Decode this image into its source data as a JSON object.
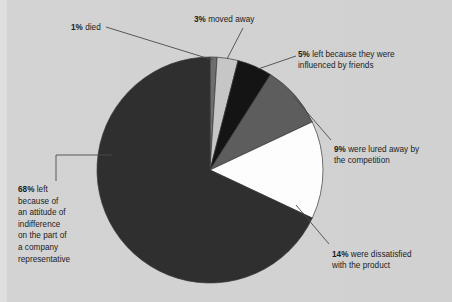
{
  "chart_data": {
    "type": "pie",
    "title": "",
    "subtitle": "",
    "xlabel": "",
    "ylabel": "",
    "legend_position": "callout-labels",
    "grid": false,
    "start_angle_deg": 0,
    "direction": "clockwise",
    "categories": [
      "died",
      "moved away",
      "left because they were influenced by friends",
      "were lured away by the competition",
      "were dissatisfied with the product",
      "left because of an attitude of indifference on the part of a company representative"
    ],
    "values": [
      1,
      3,
      5,
      9,
      14,
      68
    ],
    "value_unit": "%",
    "slice_colors": [
      "#6e6e6e",
      "#c6c6c6",
      "#141414",
      "#5d5d5d",
      "#fdfdfd",
      "#2f2f2f"
    ],
    "slices": [
      {
        "pct": "1%",
        "label": "died",
        "color": "#6e6e6e"
      },
      {
        "pct": "3%",
        "label": "moved away",
        "color": "#c6c6c6"
      },
      {
        "pct": "5%",
        "label": "left because they were influenced by friends",
        "color": "#141414"
      },
      {
        "pct": "9%",
        "label": "were lured away by the competition",
        "color": "#5d5d5d"
      },
      {
        "pct": "14%",
        "label": "were dissatisfied with the product",
        "color": "#fdfdfd"
      },
      {
        "pct": "68%",
        "label": "left because of an attitude of indifference on the part of a company representative",
        "color": "#2f2f2f"
      }
    ]
  },
  "labels": {
    "died": {
      "pct": "1%",
      "text": " died"
    },
    "moved": {
      "pct": "3%",
      "text": " moved away"
    },
    "friends": {
      "pct": "5%",
      "text": " left because they were\ninfluenced by friends"
    },
    "lured": {
      "pct": "9%",
      "text": " were lured away by\nthe competition"
    },
    "dissat": {
      "pct": "14%",
      "text": " were dissatisfied\nwith the product"
    },
    "indiff": {
      "pct": "68%",
      "text": " left\nbecause of\nan attitude of\nindifference\non the part of\na company\nrepresentative"
    }
  },
  "colors": {
    "background": "#d1d1d1",
    "text": "#1c1c1c",
    "leader_line": "#4a4a4a",
    "pie_outline": "#3a3a3a"
  }
}
